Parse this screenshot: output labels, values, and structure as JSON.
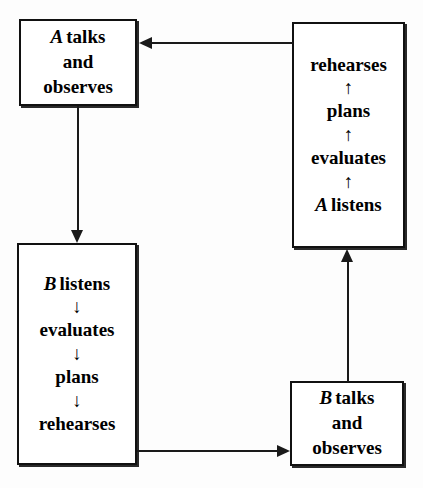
{
  "diagram": {
    "background_color": "#fdfdfd",
    "stroke_color": "#111111",
    "nodes": [
      {
        "id": "a-talks",
        "role_label": "A",
        "lines": [
          "talks",
          "and",
          "observes"
        ],
        "full_text": "A talks and observes",
        "inline_arrows": "none"
      },
      {
        "id": "b-listens",
        "role_label": "B",
        "steps": [
          "listens",
          "evaluates",
          "plans",
          "rehearses"
        ],
        "full_text": "B listens ↓ evaluates ↓ plans ↓ rehearses",
        "inline_arrows": "down",
        "arrow_glyph": "↓"
      },
      {
        "id": "a-listens",
        "role_label": "A",
        "steps": [
          "rehearses",
          "plans",
          "evaluates",
          "listens"
        ],
        "full_text": "rehearses ↑ plans ↑ evaluates ↑ A listens",
        "inline_arrows": "up",
        "arrow_glyph": "↑"
      },
      {
        "id": "b-talks",
        "role_label": "B",
        "lines": [
          "talks",
          "and",
          "observes"
        ],
        "full_text": "B talks and observes",
        "inline_arrows": "none"
      }
    ],
    "edges": [
      {
        "id": "rehearses-to-a-talks",
        "from": "a-listens",
        "to": "a-talks",
        "direction": "left"
      },
      {
        "id": "a-talks-to-b-listens",
        "from": "a-talks",
        "to": "b-listens",
        "direction": "down"
      },
      {
        "id": "b-listens-to-b-talks",
        "from": "b-listens",
        "to": "b-talks",
        "direction": "right"
      },
      {
        "id": "b-talks-to-a-listens",
        "from": "b-talks",
        "to": "a-listens",
        "direction": "up"
      }
    ]
  }
}
